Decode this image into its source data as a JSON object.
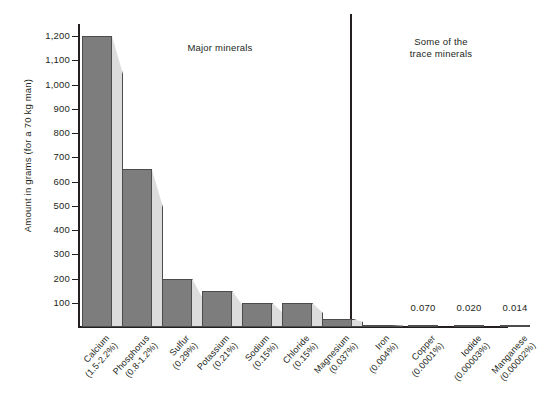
{
  "chart_data": {
    "type": "bar",
    "title": "",
    "xlabel": "",
    "ylabel": "Amount in grams (for a 70 kg man)",
    "ylim": [
      0,
      1250
    ],
    "grid": false,
    "legend": null,
    "ytick_labels": [
      "1,200",
      "1,100",
      "1,000",
      "900",
      "800",
      "700",
      "600",
      "500",
      "400",
      "300",
      "200",
      "100"
    ],
    "ytick_values": [
      1200,
      1100,
      1000,
      900,
      800,
      700,
      600,
      500,
      400,
      300,
      200,
      100
    ],
    "categories": [
      "Calcium",
      "Phosphorus",
      "Sulfur",
      "Potassium",
      "Sodium",
      "Chloride",
      "Magnesium",
      "Iron",
      "Copper",
      "Iodide",
      "Manganese"
    ],
    "category_sublabels": [
      "(1.5-2.2%)",
      "(0.8-1.2%)",
      "(0.29%)",
      "(0.21%)",
      "(0.15%)",
      "(0.15%)",
      "(0.037%)",
      "(0.004%)",
      "(0.0001%)",
      "(0.00003%)",
      "(0.00002%)"
    ],
    "values": [
      1200,
      650,
      200,
      150,
      100,
      100,
      35,
      4,
      0.07,
      0.02,
      0.014
    ],
    "point_labels": [
      "",
      "",
      "",
      "",
      "",
      "",
      "",
      "",
      "0.070",
      "0.020",
      "0.014"
    ],
    "annotations": [
      {
        "text": "Major minerals",
        "group": [
          "Calcium",
          "Phosphorus",
          "Sulfur",
          "Potassium",
          "Sodium",
          "Chloride",
          "Magnesium",
          "Iron"
        ]
      },
      {
        "text": "Some of the\ntrace minerals",
        "group": [
          "Copper",
          "Iodide",
          "Manganese"
        ]
      }
    ],
    "colors": {
      "bar_face": "#7d7d7d",
      "bar_side": "#dcdcdc",
      "outline": "#4c4c4c",
      "text": "#231f20",
      "background": "#ffffff"
    }
  },
  "axis": {
    "y_title": "Amount in grams (for a 70 kg man)",
    "ticks": [
      "1,200",
      "1,100",
      "1,000",
      "900",
      "800",
      "700",
      "600",
      "500",
      "400",
      "300",
      "200",
      "100"
    ]
  },
  "sections": {
    "major_label": "Major minerals",
    "trace_label_line1": "Some of the",
    "trace_label_line2": "trace minerals"
  },
  "bars": [
    {
      "name": "Calcium",
      "sub": "(1.5-2.2%)",
      "value": 1200,
      "value_label": ""
    },
    {
      "name": "Phosphorus",
      "sub": "(0.8-1.2%)",
      "value": 650,
      "value_label": ""
    },
    {
      "name": "Sulfur",
      "sub": "(0.29%)",
      "value": 200,
      "value_label": ""
    },
    {
      "name": "Potassium",
      "sub": "(0.21%)",
      "value": 150,
      "value_label": ""
    },
    {
      "name": "Sodium",
      "sub": "(0.15%)",
      "value": 100,
      "value_label": ""
    },
    {
      "name": "Chloride",
      "sub": "(0.15%)",
      "value": 100,
      "value_label": ""
    },
    {
      "name": "Magnesium",
      "sub": "(0.037%)",
      "value": 35,
      "value_label": ""
    },
    {
      "name": "Iron",
      "sub": "(0.004%)",
      "value": 4,
      "value_label": ""
    },
    {
      "name": "Copper",
      "sub": "(0.0001%)",
      "value": 0.07,
      "value_label": "0.070"
    },
    {
      "name": "Iodide",
      "sub": "(0.00003%)",
      "value": 0.02,
      "value_label": "0.020"
    },
    {
      "name": "Manganese",
      "sub": "(0.00002%)",
      "value": 0.014,
      "value_label": "0.014"
    }
  ],
  "caption": ""
}
